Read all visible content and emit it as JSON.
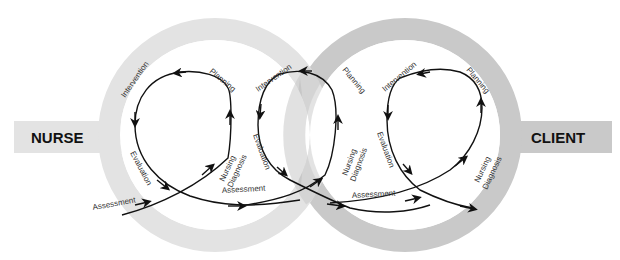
{
  "diagram": {
    "left_entity": {
      "label": "NURSE",
      "ring_color": "#e3e3e3",
      "tab_color": "#e3e3e3"
    },
    "right_entity": {
      "label": "CLIENT",
      "ring_color": "#c9c9c9",
      "tab_color": "#c9c9c9"
    },
    "line_color": "#111111",
    "loops": [
      {
        "name": "nurse-loop",
        "labels": {
          "intervention": "Intervention",
          "planning": "Planning",
          "evaluation": "Evaluation",
          "nursing_diagnosis_1": "Nursing",
          "nursing_diagnosis_2": "Diagnosis",
          "assessment": "Assessment"
        }
      },
      {
        "name": "shared-loop",
        "labels": {
          "intervention": "Intervention",
          "planning": "Planning",
          "evaluation": "Evaluation",
          "nursing_diagnosis_1": "Nursing",
          "nursing_diagnosis_2": "Diagnosis",
          "assessment": "Assessment"
        }
      },
      {
        "name": "client-loop",
        "labels": {
          "intervention": "Intervention",
          "planning": "Planning",
          "evaluation": "Evaluation",
          "nursing_diagnosis_1": "Nursing",
          "nursing_diagnosis_2": "Diagnosis",
          "assessment": "Assessment"
        }
      }
    ]
  }
}
